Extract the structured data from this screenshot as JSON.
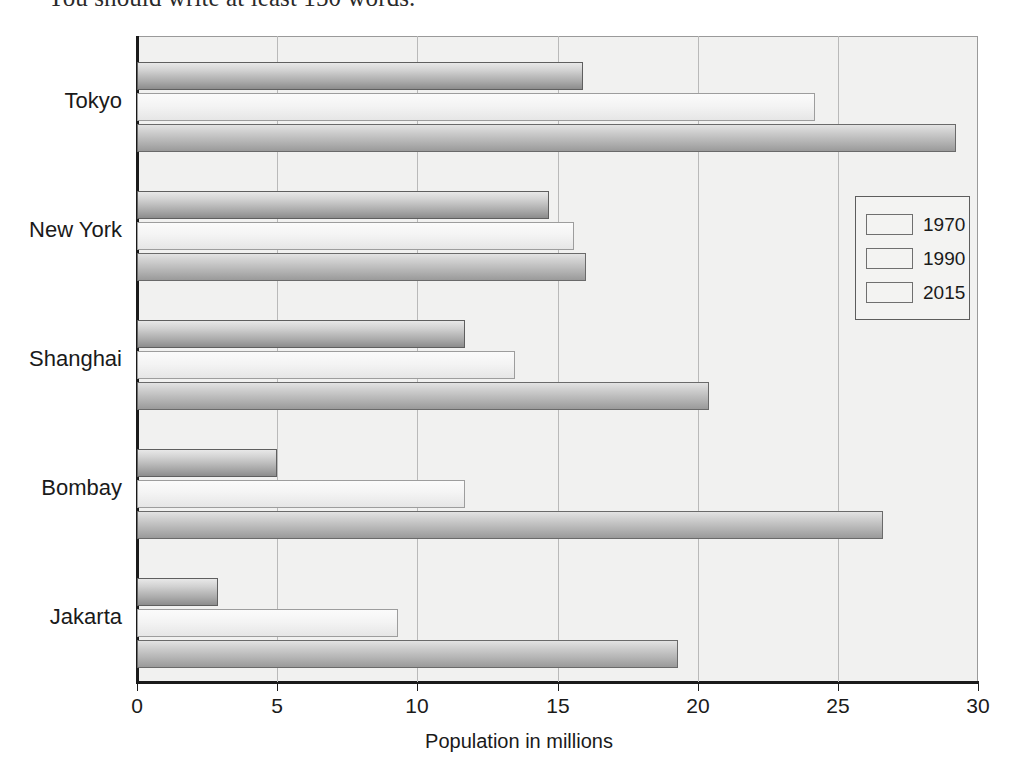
{
  "page": {
    "instruction_text": "You should write at least 150 words."
  },
  "chart_data": {
    "type": "bar",
    "orientation": "horizontal",
    "title": "",
    "subtitle": "",
    "xlabel": "Population in millions",
    "ylabel": "",
    "xlim": [
      0,
      30
    ],
    "ylim": null,
    "xticks": [
      0,
      5,
      10,
      15,
      20,
      25,
      30
    ],
    "xtick_labels": [
      "0",
      "5",
      "10",
      "15",
      "20",
      "25",
      "30"
    ],
    "grid": "vertical",
    "legend_position": "right-upper",
    "categories": [
      "Tokyo",
      "New York",
      "Shanghai",
      "Bombay",
      "Jakarta"
    ],
    "series": [
      {
        "name": "1970",
        "color": "#a9a9a9",
        "values": [
          15.9,
          14.7,
          11.7,
          5.0,
          2.9
        ]
      },
      {
        "name": "1990",
        "color": "#f4f4f4",
        "values": [
          24.2,
          15.6,
          13.5,
          11.7,
          9.3
        ]
      },
      {
        "name": "2015",
        "color": "#b0b0b0",
        "values": [
          29.2,
          16.0,
          20.4,
          26.6,
          19.3
        ]
      }
    ],
    "legend_entries": [
      "1970",
      "1990",
      "2015"
    ]
  },
  "style": {
    "plot_background": "#f1f1f0",
    "axis_color": "#1a1a1a",
    "grid_color": "#b9b9b9"
  }
}
